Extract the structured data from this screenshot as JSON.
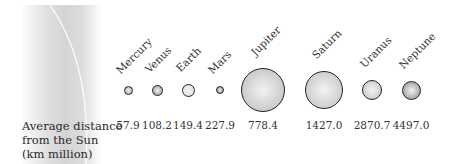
{
  "diagram": {
    "row_label": [
      "Average distance",
      "from the Sun",
      "(km million)"
    ],
    "planets": [
      {
        "name": "Mercury",
        "distance": "57.9",
        "cx": 128,
        "r": 4.5,
        "fill": "#b8b8b8"
      },
      {
        "name": "Venus",
        "distance": "108.2",
        "cx": 157,
        "r": 5.5,
        "fill": "#a9a9a9"
      },
      {
        "name": "Earth",
        "distance": "149.4",
        "cx": 188,
        "r": 6.5,
        "fill": "#e4e4e4"
      },
      {
        "name": "Mars",
        "distance": "227.9",
        "cx": 220,
        "r": 4,
        "fill": "#a0a0a0"
      },
      {
        "name": "Jupiter",
        "distance": "778.4",
        "cx": 263,
        "r": 22,
        "fill": "#c9c9c9"
      },
      {
        "name": "Saturn",
        "distance": "1427.0",
        "cx": 324,
        "r": 19,
        "fill": "#cdcdcd"
      },
      {
        "name": "Uranus",
        "distance": "2870.7",
        "cx": 372,
        "r": 10,
        "fill": "#cfcfcf"
      },
      {
        "name": "Neptune",
        "distance": "4497.0",
        "cx": 411,
        "r": 9.5,
        "fill": "#a5a5a5"
      }
    ]
  }
}
